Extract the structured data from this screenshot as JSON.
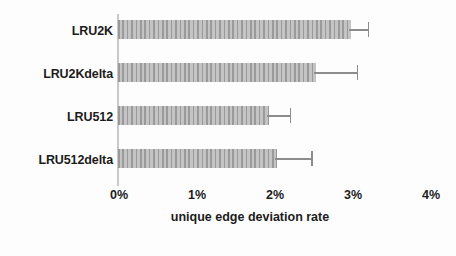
{
  "chart_data": {
    "type": "bar",
    "orientation": "horizontal",
    "title": "",
    "subtitle": "",
    "xlabel": "unique edge deviation rate",
    "ylabel": "",
    "categories": [
      "LRU2K",
      "LRU2Kdelta",
      "LRU512",
      "LRU512delta"
    ],
    "values": [
      2.99,
      2.54,
      1.93,
      2.04
    ],
    "errors_upper": [
      0.21,
      0.52,
      0.27,
      0.44
    ],
    "error_upper_absolute": [
      3.2,
      3.06,
      2.2,
      2.48
    ],
    "xlim": [
      0,
      4
    ],
    "xticks": [
      0,
      1,
      2,
      3,
      4
    ],
    "xtick_labels": [
      "0%",
      "1%",
      "2%",
      "3%",
      "4%"
    ],
    "value_unit": "%",
    "grid": false,
    "legend": null,
    "legend_position": "none",
    "series": [
      {
        "name": "unique edge deviation rate",
        "values": [
          2.99,
          2.54,
          1.93,
          2.04
        ]
      }
    ],
    "colors": {
      "bar_fill": "#b2b2b2",
      "bar_hatch": "#9a9a9a",
      "error_bar": "#8c8c8c",
      "axis": "#c9c9c9",
      "text": "#1c1c1c",
      "background": "#fdfdfd"
    }
  }
}
